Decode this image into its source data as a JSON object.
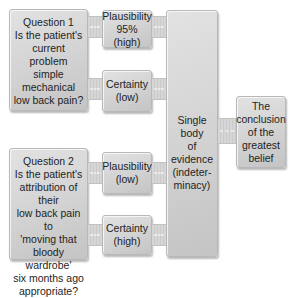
{
  "diagram": {
    "question1": {
      "title": "Question 1",
      "text": "Is the patient's\ncurrent problem\nsimple mechanical\nlow back pain?"
    },
    "question2": {
      "title": "Question 2",
      "text": "Is the patient's\nattribution of their\nlow back pain to\n'moving that\nbloody wardrobe'\nsix months ago\nappropriate?"
    },
    "q1_plausibility": "Plausibility\n95% (high)",
    "q1_certainty": "Certainty\n(low)",
    "q2_plausibility": "Plausibility\n(low)",
    "q2_certainty": "Certainty\n(high)",
    "evidence": "Single body\nof\nevidence\n(indeter-\nminacy)",
    "conclusion": "The\nconclusion\nof the\ngreatest\nbelief"
  }
}
